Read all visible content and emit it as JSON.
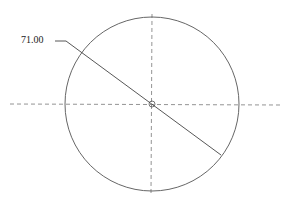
{
  "drawing": {
    "dimension_label": "71.00",
    "circle": {
      "cx": 152,
      "cy": 104,
      "r": 87
    },
    "colors": {
      "line": "#555555",
      "centerline": "#777777"
    }
  }
}
